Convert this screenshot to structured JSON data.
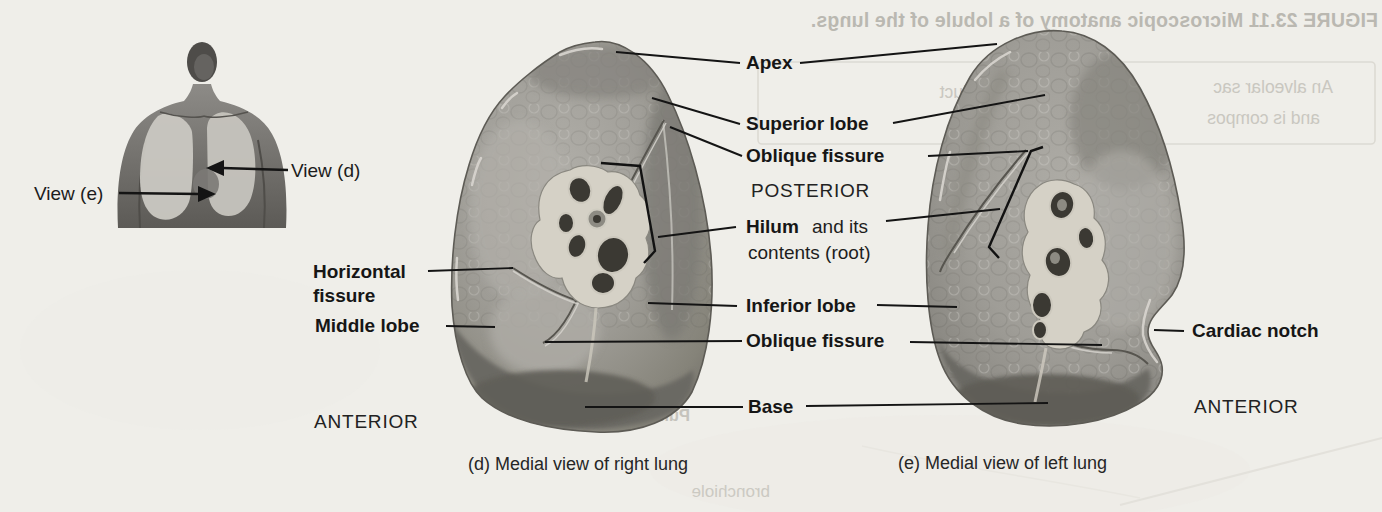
{
  "page": {
    "background": "#efeee9"
  },
  "inset": {
    "view_d_label": "View (d)",
    "view_e_label": "View (e)"
  },
  "labels": {
    "apex": "Apex",
    "superior_lobe": "Superior lobe",
    "oblique_fissure_upper": "Oblique fissure",
    "posterior": "POSTERIOR",
    "hilum_bold": "Hilum",
    "hilum_rest": "and its",
    "hilum_line2": "contents (root)",
    "inferior_lobe": "Inferior lobe",
    "oblique_fissure_lower": "Oblique fissure",
    "base": "Base",
    "horizontal_fissure_line1": "Horizontal",
    "horizontal_fissure_line2": "fissure",
    "middle_lobe": "Middle lobe",
    "anterior_left": "ANTERIOR",
    "cardiac_notch": "Cardiac notch",
    "anterior_right": "ANTERIOR"
  },
  "captions": {
    "view_d": "(d) Medial view of right lung",
    "view_e": "(e) Medial view of left lung"
  },
  "bleed_through": {
    "figure_title": "FIGURE 23.11 Microscopic anatomy of a lobule of the lungs.",
    "paragraph_frag1": "An alveolar sac",
    "paragraph_frag2": "dilation of an alveolar duct",
    "paragraph_frag3": "and is compos",
    "fragment_pulmonary": "Pulmonary alveoli",
    "fragment_bronchiole": "bronchiole"
  },
  "colors": {
    "label_text": "#161616",
    "leader_line": "#141414",
    "lung_mid": "#a19f99",
    "lung_dark": "#6b6963",
    "hilum_cream": "#d5d1c6",
    "opening_dark": "#3b3933",
    "bleed_text": "#c0beb7"
  }
}
